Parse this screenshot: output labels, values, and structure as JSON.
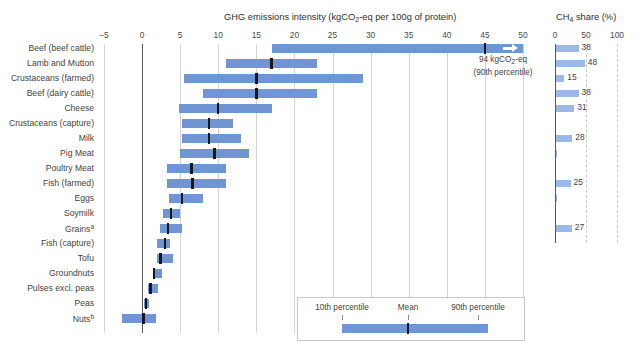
{
  "titles": {
    "main": "GHG emissions intensity (kgCO₂-eq per 100g of protein)",
    "main_prefix": "GHG emissions intensity (kgCO",
    "main_sub": "2",
    "main_suffix": "-eq per 100g of protein)",
    "ch4_prefix": "CH",
    "ch4_sub": "4",
    "ch4_suffix": " share (%)"
  },
  "annotation": {
    "line1": "94 kgCO₂-eq",
    "line1_prefix": "94 kgCO",
    "line1_sub": "2",
    "line1_suffix": "-eq",
    "line2": "(90th percentile)"
  },
  "legend": {
    "p10_label": "10th percentile",
    "mean_label": "Mean",
    "p90_label": "90th percentile"
  },
  "chart_data": {
    "type": "bar",
    "title": "GHG emissions intensity (kgCO2-eq per 100g of protein)",
    "subtitle": "",
    "xlabel": "",
    "ylabel": "",
    "grid": true,
    "legend_position": "inside-bottom-right",
    "panels": [
      {
        "name": "ghg-intensity",
        "xlim": [
          -5,
          50
        ],
        "xticks": [
          -5,
          0,
          5,
          10,
          15,
          20,
          25,
          30,
          35,
          40,
          45,
          50
        ],
        "units": "kgCO2-eq per 100g protein",
        "encoding": "floating bar from 10th to 90th percentile with mean marker"
      },
      {
        "name": "ch4-share",
        "xlim": [
          0,
          100
        ],
        "xticks": [
          0,
          50,
          100
        ],
        "units": "%"
      }
    ],
    "categories": [
      "Beef (beef cattle)",
      "Lamb and Mutton",
      "Crustaceans (farmed)",
      "Beef (dairy cattle)",
      "Cheese",
      "Crustaceans (capture)",
      "Milk",
      "Pig Meat",
      "Poultry Meat",
      "Fish (farmed)",
      "Eggs",
      "Soymilk",
      "Grains",
      "Fish (capture)",
      "Tofu",
      "Groundnuts",
      "Pulses excl. peas",
      "Peas",
      "Nuts"
    ],
    "category_footnotes": {
      "Grains": "a",
      "Nuts": "b"
    },
    "rows": [
      {
        "label": "Beef (beef cattle)",
        "footnote": "",
        "p10": 17.0,
        "p90": 50.0,
        "mean": 45.0,
        "overflow": true,
        "ch4": 38
      },
      {
        "label": "Lamb and Mutton",
        "footnote": "",
        "p10": 11.0,
        "p90": 23.0,
        "mean": 17.0,
        "overflow": false,
        "ch4": 48
      },
      {
        "label": "Crustaceans (farmed)",
        "footnote": "",
        "p10": 5.5,
        "p90": 29.0,
        "mean": 15.0,
        "overflow": false,
        "ch4": 15
      },
      {
        "label": "Beef (dairy cattle)",
        "footnote": "",
        "p10": 8.0,
        "p90": 23.0,
        "mean": 15.0,
        "overflow": false,
        "ch4": 38
      },
      {
        "label": "Cheese",
        "footnote": "",
        "p10": 4.8,
        "p90": 17.0,
        "mean": 10.0,
        "overflow": false,
        "ch4": 31
      },
      {
        "label": "Crustaceans (capture)",
        "footnote": "",
        "p10": 5.3,
        "p90": 12.0,
        "mean": 8.8,
        "overflow": false,
        "ch4": null
      },
      {
        "label": "Milk",
        "footnote": "",
        "p10": 5.3,
        "p90": 13.0,
        "mean": 8.8,
        "overflow": false,
        "ch4": 28
      },
      {
        "label": "Pig Meat",
        "footnote": "",
        "p10": 5.0,
        "p90": 14.0,
        "mean": 9.5,
        "overflow": false,
        "ch4": 2
      },
      {
        "label": "Poultry Meat",
        "footnote": "",
        "p10": 3.3,
        "p90": 11.0,
        "mean": 6.5,
        "overflow": false,
        "ch4": null
      },
      {
        "label": "Fish (farmed)",
        "footnote": "",
        "p10": 3.3,
        "p90": 11.0,
        "mean": 6.6,
        "overflow": false,
        "ch4": 25
      },
      {
        "label": "Eggs",
        "footnote": "",
        "p10": 3.5,
        "p90": 8.0,
        "mean": 5.2,
        "overflow": false,
        "ch4": 1
      },
      {
        "label": "Soymilk",
        "footnote": "",
        "p10": 2.8,
        "p90": 5.0,
        "mean": 3.8,
        "overflow": false,
        "ch4": null
      },
      {
        "label": "Grains",
        "footnote": "a",
        "p10": 2.3,
        "p90": 5.2,
        "mean": 3.4,
        "overflow": false,
        "ch4": 27
      },
      {
        "label": "Fish (capture)",
        "footnote": "",
        "p10": 2.0,
        "p90": 3.6,
        "mean": 3.0,
        "overflow": false,
        "ch4": null
      },
      {
        "label": "Tofu",
        "footnote": "",
        "p10": 1.9,
        "p90": 4.0,
        "mean": 2.4,
        "overflow": false,
        "ch4": null
      },
      {
        "label": "Groundnuts",
        "footnote": "",
        "p10": 1.4,
        "p90": 2.6,
        "mean": 1.6,
        "overflow": false,
        "ch4": null
      },
      {
        "label": "Pulses excl. peas",
        "footnote": "",
        "p10": 0.8,
        "p90": 2.1,
        "mean": 1.1,
        "overflow": false,
        "ch4": null
      },
      {
        "label": "Peas",
        "footnote": "",
        "p10": 0.3,
        "p90": 0.9,
        "mean": 0.5,
        "overflow": false,
        "ch4": null
      },
      {
        "label": "Nuts",
        "footnote": "b",
        "p10": -2.6,
        "p90": 1.8,
        "mean": 0.2,
        "overflow": false,
        "ch4": null
      }
    ]
  }
}
